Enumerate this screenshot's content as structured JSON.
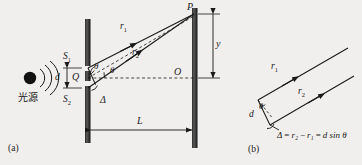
{
  "figure": {
    "background_color": "#f1efed",
    "ink_color": "#1a1a1a",
    "bar_color": "#3a3a3a",
    "panels": [
      {
        "key": "a",
        "caption": "(a)"
      },
      {
        "key": "b",
        "caption": "(b)"
      }
    ]
  },
  "panel_a": {
    "caption": "(a)",
    "source_label": "光源",
    "slit_top_label": "S",
    "slit_top_sub": "1",
    "slit_bottom_label": "S",
    "slit_bottom_sub": "2",
    "midpoint_label": "Q",
    "slit_separation_label": "d",
    "ray1_label": "r",
    "ray1_sub": "1",
    "ray2_label": "r",
    "ray2_sub": "2",
    "angle_upper_label": "θ",
    "angle_lower_label": "θ",
    "path_difference_label": "Δ",
    "point_p_label": "P",
    "origin_label": "O",
    "screen_distance_label": "L",
    "fringe_position_label": "y"
  },
  "panel_b": {
    "caption": "(b)",
    "ray1_label": "r",
    "ray1_sub": "1",
    "ray2_label": "r",
    "ray2_sub": "2",
    "slit_separation_label": "d",
    "angle_label": "θ",
    "equation": "Δ = r₂ − r₁ = d sin θ",
    "equation_parts": {
      "delta": "Δ",
      "eq1": "=",
      "r2": "r₂",
      "minus": "−",
      "r1": "r₁",
      "eq2": "=",
      "result": "d sin θ"
    }
  }
}
